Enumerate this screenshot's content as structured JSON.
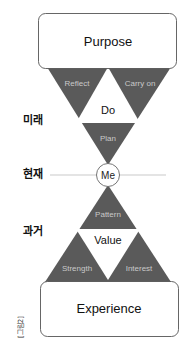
{
  "diagram": {
    "top_box": {
      "label": "Purpose"
    },
    "bottom_box": {
      "label": "Experience"
    },
    "future_triangle": {
      "left": "Reflect",
      "right": "Carry on",
      "center": "Do",
      "bottom": "Plan"
    },
    "center_node": {
      "label": "Me"
    },
    "past_triangle": {
      "top": "Pattern",
      "center": "Value",
      "left": "Strength",
      "right": "Interest"
    },
    "time_labels": {
      "future": "미래",
      "present": "현재",
      "past": "과거"
    },
    "caption": "[그림2]",
    "colors": {
      "triangle_fill": "#5a5a5a",
      "triangle_text": "#c9c9c9",
      "box_stroke": "#555555",
      "line": "#bbbbbb"
    }
  }
}
